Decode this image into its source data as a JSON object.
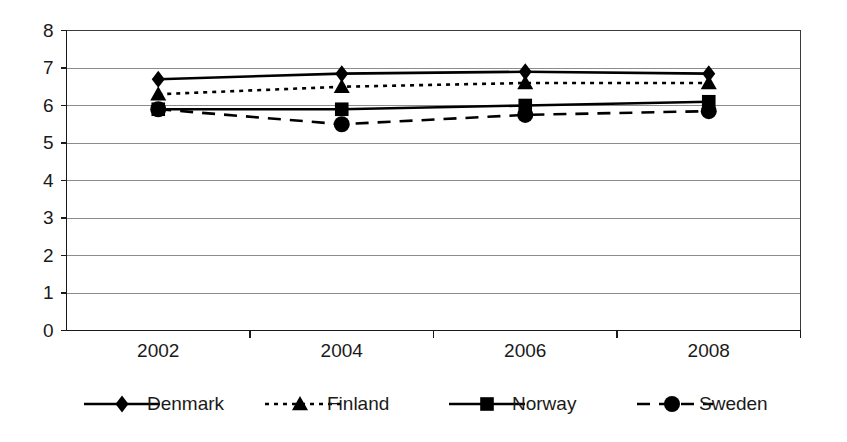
{
  "chart_data": {
    "type": "line",
    "title": "",
    "subtitle": "",
    "xlabel": "",
    "ylabel": "",
    "categories": [
      "2002",
      "2004",
      "2006",
      "2008"
    ],
    "ylim": [
      0,
      8
    ],
    "ytick_values": [
      0,
      1,
      2,
      3,
      4,
      5,
      6,
      7,
      8
    ],
    "ytick_labels": [
      "0",
      "1",
      "2",
      "3",
      "4",
      "5",
      "6",
      "7",
      "8"
    ],
    "grid": "horizontal",
    "legend_position": "bottom",
    "series": [
      {
        "name": "Denmark",
        "values": [
          6.7,
          6.85,
          6.9,
          6.85
        ],
        "marker": "diamond",
        "linestyle": "solid",
        "color": "#000000"
      },
      {
        "name": "Finland",
        "values": [
          6.3,
          6.5,
          6.6,
          6.6
        ],
        "marker": "triangle",
        "linestyle": "dotted",
        "color": "#000000"
      },
      {
        "name": "Norway",
        "values": [
          5.9,
          5.9,
          6.0,
          6.1
        ],
        "marker": "square",
        "linestyle": "solid",
        "color": "#000000"
      },
      {
        "name": "Sweden",
        "values": [
          5.9,
          5.5,
          5.75,
          5.85
        ],
        "marker": "circle",
        "linestyle": "dashed",
        "color": "#000000"
      }
    ]
  },
  "legend": {
    "items": [
      {
        "label": "Denmark",
        "marker": "diamond-marker-icon",
        "linestyle": "solid"
      },
      {
        "label": "Finland",
        "marker": "triangle-marker-icon",
        "linestyle": "dotted"
      },
      {
        "label": "Norway",
        "marker": "square-marker-icon",
        "linestyle": "solid"
      },
      {
        "label": "Sweden",
        "marker": "circle-marker-icon",
        "linestyle": "dashed"
      }
    ]
  }
}
